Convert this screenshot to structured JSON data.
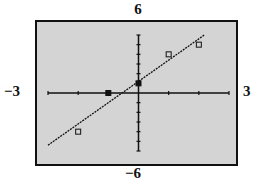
{
  "chart_data": {
    "type": "scatter",
    "title": "",
    "xlabel": "",
    "ylabel": "",
    "xlim": [
      -3,
      3
    ],
    "ylim": [
      -6,
      6
    ],
    "xscale": 1,
    "yscale": 1,
    "grid": false,
    "window_labels": {
      "xmin": "−3",
      "xmax": "3",
      "ymin": "−6",
      "ymax": "6"
    },
    "series": [
      {
        "name": "data points",
        "type": "scatter",
        "marker": "square",
        "x": [
          -2,
          -1,
          0,
          1,
          2
        ],
        "y": [
          -4,
          0,
          1,
          4,
          5
        ]
      },
      {
        "name": "regression line",
        "type": "line",
        "slope": 2.2,
        "intercept": 1.2,
        "x": [
          -3,
          2.2
        ],
        "y": [
          -5.4,
          6.04
        ]
      }
    ]
  },
  "colors": {
    "background": "#d4d4d4",
    "axis": "#111111",
    "frame": "#111111"
  }
}
